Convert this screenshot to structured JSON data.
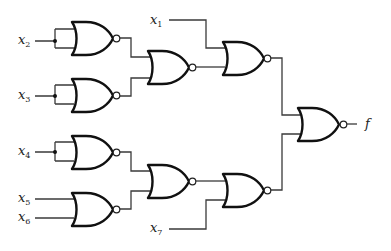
{
  "diagram": {
    "type": "logic-circuit",
    "gate_type": "NOR",
    "inputs": [
      {
        "var": "x",
        "sub": "1"
      },
      {
        "var": "x",
        "sub": "2"
      },
      {
        "var": "x",
        "sub": "3"
      },
      {
        "var": "x",
        "sub": "4"
      },
      {
        "var": "x",
        "sub": "5"
      },
      {
        "var": "x",
        "sub": "6"
      },
      {
        "var": "x",
        "sub": "7"
      }
    ],
    "output": {
      "label": "f"
    },
    "colors": {
      "line": "#3a3a3a",
      "gate": "#111111",
      "background": "#ffffff"
    },
    "gates": [
      {
        "id": "g1",
        "type": "NOR",
        "inputs": [
          "x2",
          "x2"
        ]
      },
      {
        "id": "g2",
        "type": "NOR",
        "inputs": [
          "x3",
          "x3"
        ]
      },
      {
        "id": "g3",
        "type": "NOR",
        "inputs": [
          "g1",
          "g2"
        ]
      },
      {
        "id": "g4",
        "type": "NOR",
        "inputs": [
          "x1",
          "g3"
        ]
      },
      {
        "id": "g5",
        "type": "NOR",
        "inputs": [
          "x4",
          "x4"
        ]
      },
      {
        "id": "g6",
        "type": "NOR",
        "inputs": [
          "x5",
          "x6"
        ]
      },
      {
        "id": "g7",
        "type": "NOR",
        "inputs": [
          "g5",
          "g6"
        ]
      },
      {
        "id": "g8",
        "type": "NOR",
        "inputs": [
          "g7",
          "x7"
        ]
      },
      {
        "id": "g9",
        "type": "NOR",
        "inputs": [
          "g4",
          "g8"
        ],
        "output": "f"
      }
    ]
  }
}
